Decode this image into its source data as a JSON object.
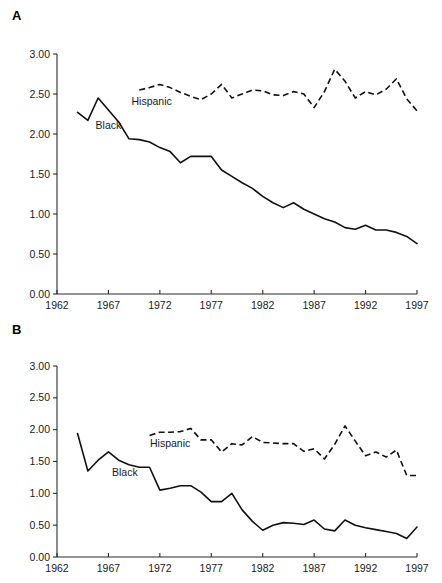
{
  "figure": {
    "background": "#ffffff",
    "ink_color": "#111111"
  },
  "panels": [
    {
      "id": "A",
      "label": "A",
      "series_labels": {
        "black": "Black",
        "hispanic": "Hispanic"
      }
    },
    {
      "id": "B",
      "label": "B",
      "series_labels": {
        "black": "Black",
        "hispanic": "Hispanic"
      }
    }
  ],
  "chart_data": [
    {
      "type": "line",
      "panel": "A",
      "title": "",
      "xlabel": "",
      "ylabel": "",
      "xlim": [
        1962,
        1997
      ],
      "ylim": [
        0.0,
        3.0
      ],
      "xticks": [
        1962,
        1967,
        1972,
        1977,
        1982,
        1987,
        1992,
        1997
      ],
      "xticklabels": [
        "1962",
        "1967",
        "1972",
        "1977",
        "1982",
        "1987",
        "1992",
        "1997"
      ],
      "yticks": [
        0.0,
        0.5,
        1.0,
        1.5,
        2.0,
        2.5,
        3.0
      ],
      "yticklabels": [
        "0.00",
        "0.50",
        "1.00",
        "1.50",
        "2.00",
        "2.50",
        "3.00"
      ],
      "grid": false,
      "legend": "inline-annotation",
      "series": [
        {
          "name": "Black",
          "style": "solid",
          "label_x": 1967.0,
          "label_y": 2.06,
          "x": [
            1964,
            1965,
            1966,
            1967,
            1968,
            1969,
            1970,
            1971,
            1972,
            1973,
            1974,
            1975,
            1976,
            1977,
            1978,
            1979,
            1980,
            1981,
            1982,
            1983,
            1984,
            1985,
            1986,
            1987,
            1988,
            1989,
            1990,
            1991,
            1992,
            1993,
            1994,
            1995,
            1996,
            1997
          ],
          "values": [
            2.27,
            2.17,
            2.45,
            2.3,
            2.15,
            1.94,
            1.93,
            1.9,
            1.83,
            1.78,
            1.64,
            1.72,
            1.72,
            1.72,
            1.55,
            1.47,
            1.39,
            1.32,
            1.22,
            1.14,
            1.08,
            1.14,
            1.06,
            1.0,
            0.94,
            0.9,
            0.83,
            0.81,
            0.86,
            0.8,
            0.8,
            0.77,
            0.72,
            0.63
          ]
        },
        {
          "name": "Hispanic",
          "style": "dashed",
          "label_x": 1971.2,
          "label_y": 2.36,
          "x": [
            1970,
            1971,
            1972,
            1973,
            1974,
            1975,
            1976,
            1977,
            1978,
            1979,
            1980,
            1981,
            1982,
            1983,
            1984,
            1985,
            1986,
            1987,
            1988,
            1989,
            1990,
            1991,
            1992,
            1993,
            1994,
            1995,
            1996,
            1997
          ],
          "values": [
            2.55,
            2.58,
            2.62,
            2.58,
            2.52,
            2.47,
            2.43,
            2.5,
            2.62,
            2.45,
            2.5,
            2.55,
            2.54,
            2.49,
            2.48,
            2.53,
            2.5,
            2.33,
            2.53,
            2.81,
            2.66,
            2.45,
            2.53,
            2.49,
            2.56,
            2.69,
            2.44,
            2.29
          ]
        }
      ]
    },
    {
      "type": "line",
      "panel": "B",
      "title": "",
      "xlabel": "",
      "ylabel": "",
      "xlim": [
        1962,
        1997
      ],
      "ylim": [
        0.0,
        3.0
      ],
      "xticks": [
        1962,
        1967,
        1972,
        1977,
        1982,
        1987,
        1992,
        1997
      ],
      "xticklabels": [
        "1962",
        "1967",
        "1972",
        "1977",
        "1982",
        "1987",
        "1992",
        "1997"
      ],
      "yticks": [
        0.0,
        0.5,
        1.0,
        1.5,
        2.0,
        2.5,
        3.0
      ],
      "yticklabels": [
        "0.00",
        "0.50",
        "1.00",
        "1.50",
        "2.00",
        "2.50",
        "3.00"
      ],
      "grid": false,
      "legend": "inline-annotation",
      "series": [
        {
          "name": "Black",
          "style": "solid",
          "label_x": 1968.6,
          "label_y": 1.28,
          "x": [
            1964,
            1965,
            1966,
            1967,
            1968,
            1969,
            1970,
            1971,
            1972,
            1973,
            1974,
            1975,
            1976,
            1977,
            1978,
            1979,
            1980,
            1981,
            1982,
            1983,
            1984,
            1985,
            1986,
            1987,
            1988,
            1989,
            1990,
            1991,
            1992,
            1993,
            1994,
            1995,
            1996,
            1997
          ],
          "values": [
            1.94,
            1.35,
            1.52,
            1.65,
            1.52,
            1.45,
            1.41,
            1.41,
            1.05,
            1.08,
            1.12,
            1.12,
            1.02,
            0.87,
            0.87,
            1.0,
            0.74,
            0.56,
            0.42,
            0.5,
            0.54,
            0.53,
            0.51,
            0.58,
            0.44,
            0.41,
            0.58,
            0.5,
            0.46,
            0.43,
            0.4,
            0.37,
            0.29,
            0.47,
            0.41
          ]
        },
        {
          "name": "Hispanic",
          "style": "dashed",
          "label_x": 1973.0,
          "label_y": 1.72,
          "x": [
            1971,
            1972,
            1973,
            1974,
            1975,
            1976,
            1977,
            1978,
            1979,
            1980,
            1981,
            1982,
            1983,
            1984,
            1985,
            1986,
            1987,
            1988,
            1989,
            1990,
            1991,
            1992,
            1993,
            1994,
            1995,
            1996,
            1997
          ],
          "values": [
            1.91,
            1.96,
            1.96,
            1.97,
            2.02,
            1.84,
            1.84,
            1.65,
            1.78,
            1.76,
            1.89,
            1.8,
            1.79,
            1.78,
            1.78,
            1.66,
            1.7,
            1.54,
            1.77,
            2.06,
            1.82,
            1.59,
            1.65,
            1.57,
            1.68,
            1.28,
            1.28
          ]
        }
      ]
    }
  ]
}
